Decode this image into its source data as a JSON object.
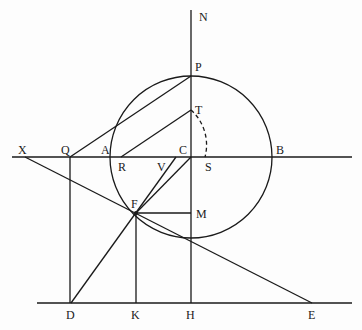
{
  "diagram": {
    "type": "geometric construction",
    "stroke_color": "#1a1a1a",
    "background": "#fdfdfd",
    "circle": {
      "name": "circle",
      "cx": 191,
      "cy": 157,
      "r": 81
    },
    "points": {
      "N": {
        "x": 191,
        "y": 10
      },
      "P": {
        "x": 191,
        "y": 76
      },
      "T": {
        "x": 191,
        "y": 110
      },
      "C": {
        "x": 191,
        "y": 157
      },
      "S": {
        "x": 205,
        "y": 157
      },
      "B": {
        "x": 272,
        "y": 157
      },
      "A": {
        "x": 111,
        "y": 157
      },
      "R": {
        "x": 121,
        "y": 157
      },
      "V": {
        "x": 176,
        "y": 157
      },
      "Q": {
        "x": 70,
        "y": 157
      },
      "X": {
        "x": 25,
        "y": 157
      },
      "F": {
        "x": 136,
        "y": 213
      },
      "M": {
        "x": 191,
        "y": 213
      },
      "D": {
        "x": 71,
        "y": 303
      },
      "K": {
        "x": 136,
        "y": 303
      },
      "H": {
        "x": 191,
        "y": 303
      },
      "E": {
        "x": 312,
        "y": 303
      }
    },
    "labels": [
      {
        "text": "N",
        "x": 199,
        "y": 21
      },
      {
        "text": "P",
        "x": 195,
        "y": 71
      },
      {
        "text": "T",
        "x": 195,
        "y": 113
      },
      {
        "text": "C",
        "x": 179,
        "y": 154
      },
      {
        "text": "B",
        "x": 276,
        "y": 154
      },
      {
        "text": "A",
        "x": 101,
        "y": 154
      },
      {
        "text": "Q",
        "x": 61,
        "y": 154
      },
      {
        "text": "X",
        "x": 18,
        "y": 154
      },
      {
        "text": "R",
        "x": 118,
        "y": 171
      },
      {
        "text": "V",
        "x": 157,
        "y": 171
      },
      {
        "text": "S",
        "x": 205,
        "y": 171
      },
      {
        "text": "F",
        "x": 131,
        "y": 208
      },
      {
        "text": "M",
        "x": 196,
        "y": 218
      },
      {
        "text": "D",
        "x": 66,
        "y": 319
      },
      {
        "text": "K",
        "x": 131,
        "y": 319
      },
      {
        "text": "H",
        "x": 186,
        "y": 319
      },
      {
        "text": "E",
        "x": 308,
        "y": 319
      }
    ]
  }
}
